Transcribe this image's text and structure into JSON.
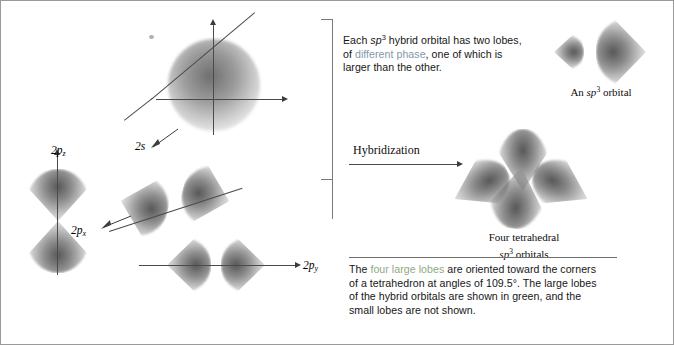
{
  "figure": {
    "title_left_group": "Atomic orbitals of carbon",
    "title_right_group": "sp3 hybrid orbitals"
  },
  "left_panel": {
    "orbitals": [
      {
        "id": "2s",
        "label_text": "2s",
        "sub": "",
        "name": "orbital-label-2s"
      },
      {
        "id": "2pz",
        "label_text": "2p",
        "sub": "z",
        "name": "orbital-label-2pz"
      },
      {
        "id": "2px",
        "label_text": "2p",
        "sub": "x",
        "name": "orbital-label-2px"
      },
      {
        "id": "2py",
        "label_text": "2p",
        "sub": "y",
        "name": "orbital-label-2py"
      }
    ]
  },
  "transform": {
    "arrow_label": "Hybridization"
  },
  "right_panel": {
    "top_note": {
      "line1_a": "Each ",
      "line1_sp": "sp",
      "line1_sup": "3",
      "line1_b": " hybrid orbital has two lobes,",
      "line2_a": "of ",
      "line2_accent": "different phase",
      "line2_b": ", one of which is",
      "line3": "larger than the other."
    },
    "sp3_caption": {
      "prefix": "An ",
      "sp": "sp",
      "sup": "3",
      "suffix": " orbital"
    },
    "tetrahedral_caption": {
      "line1": "Four tetrahedral",
      "sp": "sp",
      "sup": "3",
      "line2_suffix": " orbitals"
    },
    "bottom_note": {
      "line1_a": "The ",
      "line1_accent": "four large lobes",
      "line1_b": " are oriented toward the corners",
      "line2": "of a tetrahedron at angles of 109.5°. The large lobes",
      "line3": "of the hybrid orbitals are shown in green, and the",
      "line4": "small lobes are not shown."
    }
  },
  "colors": {
    "accent_phase": "#7f9aa8",
    "accent_green": "#8fa87f",
    "orbital_fill": "#4a4a4a",
    "border": "#9a9a9a",
    "axis": "#4a4a4a"
  }
}
